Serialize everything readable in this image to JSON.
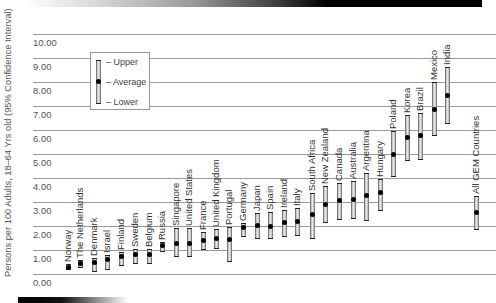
{
  "chart_data": {
    "type": "errorbar",
    "title": "",
    "xlabel": "",
    "ylabel": "Persons per 100 Adults, 18–64 Yrs old (95% Confidence Interval)",
    "ylim": [
      0,
      10
    ],
    "yticks": [
      "0.00",
      "1.00",
      "2.00",
      "3.00",
      "4.00",
      "5.00",
      "6.00",
      "7.00",
      "8.00",
      "9.00",
      "10.00"
    ],
    "grid": true,
    "legend": {
      "position": "upper-left",
      "entries": [
        "Upper",
        "Average",
        "Lower"
      ]
    },
    "categories": [
      "Norway",
      "The Netherlands",
      "Denmark",
      "Israel",
      "Finland",
      "Sweden",
      "Belgium",
      "Russia",
      "Singapore",
      "United States",
      "France",
      "United Kingdom",
      "Portugal",
      "Germany",
      "Japan",
      "Spain",
      "Ireland",
      "Italy",
      "South Africa",
      "New Zealand",
      "Canada",
      "Australia",
      "Argentina",
      "Hungary",
      "Poland",
      "Korea",
      "Brazil",
      "Mexico",
      "India",
      "All GEM Countries"
    ],
    "series": [
      {
        "name": "Upper",
        "values": [
          0.4,
          0.57,
          0.65,
          0.8,
          0.93,
          1.05,
          1.05,
          1.35,
          1.92,
          1.92,
          1.75,
          1.87,
          1.94,
          2.12,
          2.54,
          2.6,
          2.68,
          2.75,
          3.37,
          3.67,
          3.8,
          3.86,
          4.2,
          3.96,
          5.95,
          6.62,
          6.69,
          8.0,
          8.62,
          3.25
        ]
      },
      {
        "name": "Average",
        "values": [
          0.26,
          0.42,
          0.48,
          0.6,
          0.75,
          0.82,
          0.82,
          1.18,
          1.28,
          1.28,
          1.39,
          1.47,
          1.45,
          1.92,
          2.01,
          2.0,
          2.13,
          2.19,
          2.46,
          2.9,
          3.05,
          3.12,
          3.26,
          3.41,
          4.98,
          5.7,
          5.77,
          6.85,
          7.44,
          2.55
        ]
      },
      {
        "name": "Lower",
        "values": [
          0.17,
          0.26,
          0.1,
          0.17,
          0.35,
          0.4,
          0.4,
          0.93,
          0.69,
          0.69,
          1.01,
          1.05,
          0.48,
          1.56,
          1.46,
          1.47,
          1.53,
          1.6,
          1.47,
          2.14,
          2.25,
          2.3,
          2.22,
          2.61,
          4.03,
          4.7,
          4.77,
          5.74,
          6.27,
          1.85
        ]
      }
    ]
  }
}
